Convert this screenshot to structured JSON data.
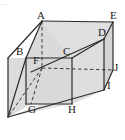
{
  "figure": {
    "kind": "geometry-diagram",
    "corner_mark": "...",
    "colors": {
      "stroke": "#2b2b2b",
      "hidden_stroke": "#3a3a3a",
      "face_fill": "#d9d9d9",
      "face_fill_light": "#e4e4e4",
      "background": "#ffffff",
      "label": "#1a1a1a"
    },
    "vertices": [
      {
        "id": "A",
        "label": "A",
        "x": 42,
        "y": 21,
        "label_x": 37,
        "label_y": 10
      },
      {
        "id": "E",
        "label": "E",
        "x": 113,
        "y": 22,
        "label_x": 110,
        "label_y": 10
      },
      {
        "id": "D",
        "label": "D",
        "x": 104,
        "y": 39,
        "label_x": 98,
        "label_y": 27
      },
      {
        "id": "B",
        "label": "B",
        "x": 26,
        "y": 58,
        "label_x": 17,
        "label_y": 46
      },
      {
        "id": "C",
        "label": "C",
        "x": 72,
        "y": 58,
        "label_x": 63,
        "label_y": 46
      },
      {
        "id": "F",
        "label": "F",
        "x": 42,
        "y": 68,
        "label_x": 33,
        "label_y": 55
      },
      {
        "id": "J",
        "label": "J",
        "x": 113,
        "y": 70,
        "label_x": 115,
        "label_y": 63
      },
      {
        "id": "I",
        "label": "I",
        "x": 104,
        "y": 90,
        "label_x": 108,
        "label_y": 81
      },
      {
        "id": "G",
        "label": "G",
        "x": 31,
        "y": 104,
        "label_x": 28,
        "label_y": 104
      },
      {
        "id": "H",
        "label": "H",
        "x": 72,
        "y": 104,
        "label_x": 69,
        "label_y": 104
      }
    ],
    "edges_solid": [
      "A-E",
      "A-B",
      "B-C",
      "C-D",
      "D-E",
      "E-J",
      "D-I",
      "B-G",
      "C-H",
      "G-H",
      "A-C"
    ],
    "edges_hidden": [
      "A-F",
      "F-G",
      "F-J",
      "B-F"
    ]
  }
}
